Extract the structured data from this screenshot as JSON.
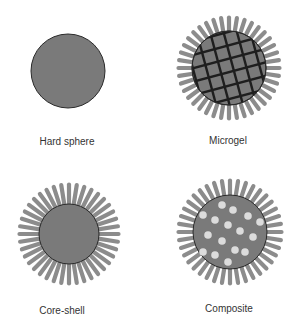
{
  "colors": {
    "core": "#7a7a7a",
    "outline": "#2a2a2a",
    "shell_rod": "#8c8c8c",
    "crosslink": "#1e1e1e",
    "inclusion": "#dcdcdc",
    "background": "#ffffff"
  },
  "panels": [
    {
      "id": "hard-sphere",
      "label": "Hard sphere",
      "cx": 68,
      "cy": 71,
      "core_r": 37,
      "shell": false,
      "crosslinked": false,
      "inclusions": false,
      "label_x": 67,
      "label_y": 136
    },
    {
      "id": "microgel",
      "label": "Microgel",
      "cx": 229,
      "cy": 68,
      "core_r": 37,
      "shell": true,
      "shell_r": 53,
      "crosslinked": true,
      "inclusions": false,
      "label_x": 228,
      "label_y": 135
    },
    {
      "id": "core-shell",
      "label": "Core-shell",
      "cx": 69,
      "cy": 234,
      "core_r": 30,
      "shell": true,
      "shell_r": 52,
      "crosslinked": false,
      "inclusions": false,
      "label_x": 62,
      "label_y": 305
    },
    {
      "id": "composite",
      "label": "Composite",
      "cx": 230,
      "cy": 232,
      "core_r": 37,
      "shell": true,
      "shell_r": 54,
      "crosslinked": false,
      "inclusions": true,
      "label_x": 229,
      "label_y": 303
    }
  ],
  "inclusion_points": [
    [
      222,
      205
    ],
    [
      233,
      210
    ],
    [
      252,
      202
    ],
    [
      203,
      215
    ],
    [
      215,
      220
    ],
    [
      228,
      225
    ],
    [
      248,
      216
    ],
    [
      260,
      222
    ],
    [
      208,
      235
    ],
    [
      222,
      241
    ],
    [
      240,
      231
    ],
    [
      253,
      237
    ],
    [
      203,
      252
    ],
    [
      215,
      255
    ],
    [
      228,
      262
    ],
    [
      245,
      252
    ],
    [
      258,
      257
    ],
    [
      265,
      242
    ],
    [
      243,
      268
    ],
    [
      235,
      250
    ]
  ]
}
